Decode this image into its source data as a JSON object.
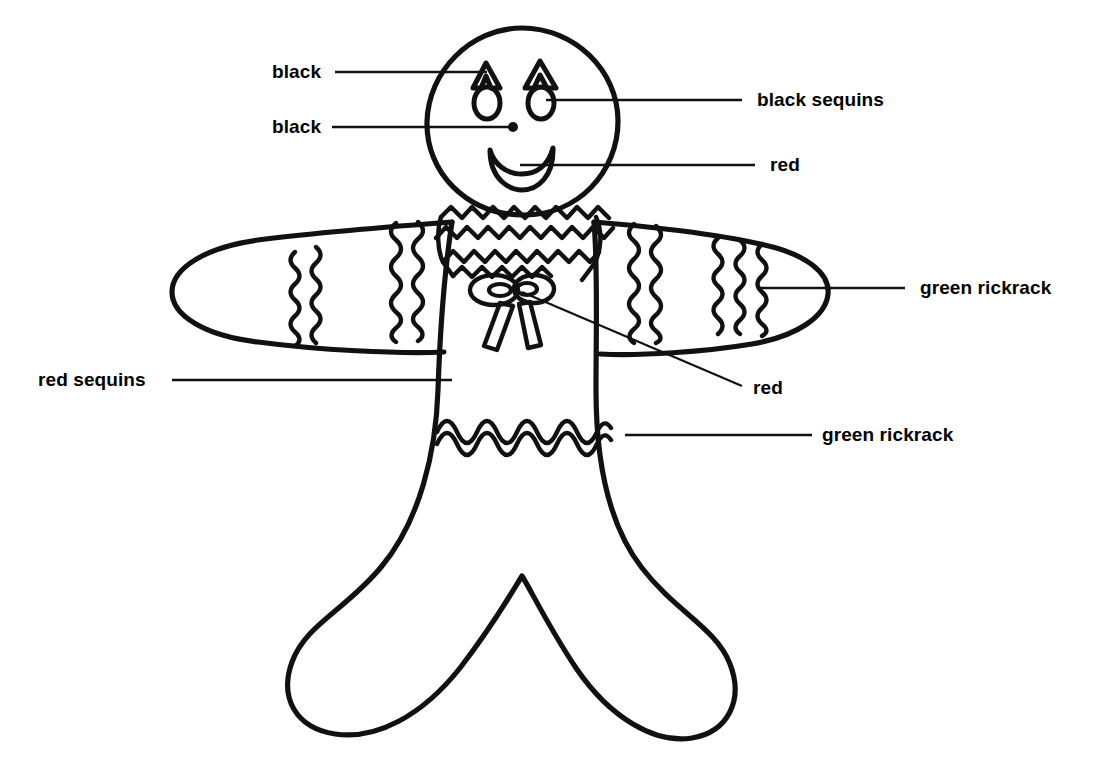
{
  "figure": {
    "background_color": "#ffffff",
    "ink_color": "#111111"
  },
  "annotations": [
    {
      "id": "eyebrows",
      "label": "black",
      "side": "left",
      "label_x": 272,
      "label_y": 62,
      "leader": [
        [
          335,
          72
        ],
        [
          487,
          72
        ]
      ]
    },
    {
      "id": "nose",
      "label": "black",
      "side": "left",
      "label_x": 272,
      "label_y": 117,
      "leader": [
        [
          332,
          127
        ],
        [
          512,
          127
        ]
      ]
    },
    {
      "id": "eyes",
      "label": "black sequins",
      "side": "right",
      "label_x": 757,
      "label_y": 95,
      "leader": [
        [
          546,
          100
        ],
        [
          742,
          100
        ]
      ]
    },
    {
      "id": "mouth",
      "label": "red",
      "side": "right",
      "label_x": 770,
      "label_y": 160,
      "leader": [
        [
          520,
          165
        ],
        [
          755,
          165
        ]
      ]
    },
    {
      "id": "arm-rickrack",
      "label": "green rickrack",
      "side": "right",
      "label_x": 920,
      "label_y": 278,
      "leader": [
        [
          758,
          288
        ],
        [
          905,
          288
        ]
      ]
    },
    {
      "id": "arm-sequins",
      "label": "red sequins",
      "side": "left",
      "label_x": 38,
      "label_y": 370,
      "leader": [
        [
          172,
          380
        ],
        [
          452,
          380
        ]
      ]
    },
    {
      "id": "bow",
      "label": "red",
      "side": "right",
      "label_x": 753,
      "label_y": 378,
      "leader": [
        [
          522,
          292
        ],
        [
          742,
          386
        ]
      ]
    },
    {
      "id": "waist-rickrack",
      "label": "green rickrack",
      "side": "right",
      "label_x": 822,
      "label_y": 425,
      "leader": [
        [
          625,
          435
        ],
        [
          812,
          435
        ]
      ]
    }
  ],
  "parts": {
    "head": "oval-head",
    "eyebrows": "chevron-eyebrows",
    "eyes": "oval-eyes",
    "nose": "dot-nose",
    "mouth": "crescent-smile",
    "collar": "ruffled-collar-rickrack",
    "bow": "neck-bow",
    "left_arm": "left-arm",
    "right_arm": "right-arm",
    "torso": "torso",
    "legs": "legs",
    "waistband": "waist-rickrack-band"
  }
}
